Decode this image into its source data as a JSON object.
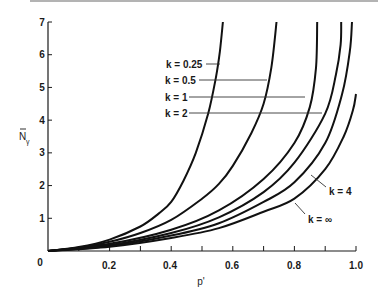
{
  "chart_data": {
    "type": "line",
    "title": "",
    "xlabel": "p'",
    "ylabel": "N̄γ",
    "xlim": [
      0,
      1.0
    ],
    "ylim": [
      0,
      7
    ],
    "grid": false,
    "legend": "inline labels with leader lines",
    "x_ticks": [
      "0",
      "0.2",
      "0.4",
      "0.6",
      "0.8",
      "1.0"
    ],
    "x_minor_tick_step": 0.1,
    "y_ticks": [
      "0",
      "1",
      "2",
      "3",
      "4",
      "5",
      "6",
      "7"
    ],
    "series": [
      {
        "name": "k = 0.25",
        "x": [
          0,
          0.1,
          0.2,
          0.3,
          0.36,
          0.4,
          0.44,
          0.48,
          0.52,
          0.545,
          0.558,
          0.568
        ],
        "y": [
          0,
          0.12,
          0.35,
          0.75,
          1.15,
          1.5,
          2.15,
          3.0,
          4.2,
          5.3,
          6.1,
          7.0
        ]
      },
      {
        "name": "k = 0.5",
        "x": [
          0,
          0.1,
          0.2,
          0.3,
          0.4,
          0.5,
          0.555,
          0.6,
          0.66,
          0.7,
          0.725,
          0.742
        ],
        "y": [
          0,
          0.1,
          0.28,
          0.55,
          0.95,
          1.6,
          2.05,
          2.6,
          3.6,
          4.5,
          5.6,
          7.0
        ]
      },
      {
        "name": "k = 1",
        "x": [
          0,
          0.2,
          0.4,
          0.555,
          0.7,
          0.8,
          0.85,
          0.87,
          0.874
        ],
        "y": [
          0,
          0.22,
          0.65,
          1.24,
          2.2,
          3.3,
          4.4,
          5.6,
          7.0
        ]
      },
      {
        "name": "k = 2",
        "x": [
          0,
          0.2,
          0.4,
          0.555,
          0.7,
          0.8,
          0.9,
          0.935,
          0.95,
          0.952
        ],
        "y": [
          0,
          0.18,
          0.55,
          1.03,
          1.8,
          2.7,
          4.2,
          5.4,
          6.3,
          7.0
        ]
      },
      {
        "name": "k = 4",
        "x": [
          0,
          0.2,
          0.4,
          0.555,
          0.7,
          0.8,
          0.9,
          0.955,
          0.98,
          0.987
        ],
        "y": [
          0,
          0.15,
          0.47,
          0.85,
          1.5,
          2.1,
          3.3,
          4.8,
          6.1,
          7.0
        ]
      },
      {
        "name": "k = ∞",
        "x": [
          0,
          0.2,
          0.4,
          0.555,
          0.7,
          0.8,
          0.9,
          0.96,
          0.99,
          1.0
        ],
        "y": [
          0,
          0.13,
          0.4,
          0.7,
          1.2,
          1.6,
          2.5,
          3.5,
          4.3,
          4.8
        ]
      }
    ]
  },
  "labels": {
    "k025": "k = 0.25",
    "k05": "k = 0.5",
    "k1": "k = 1",
    "k2": "k = 2",
    "k4": "k = 4",
    "kinf": "k = ∞",
    "xlabel": "p'",
    "ylabel_main": "N",
    "ylabel_sub": "γ"
  },
  "ticks": {
    "x": [
      "0",
      "0.2",
      "0.4",
      "0.6",
      "0.8",
      "1.0"
    ],
    "y": [
      "1",
      "2",
      "3",
      "4",
      "5",
      "6",
      "7"
    ]
  },
  "colors": {
    "curve": "#111111",
    "axis": "#1a1a1a",
    "background": "#ffffff"
  }
}
